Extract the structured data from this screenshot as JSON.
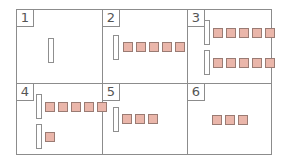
{
  "diagram": {
    "grid": {
      "columns": 3,
      "rows": 2
    },
    "colors": {
      "square_fill": "#eab6aa",
      "square_border": "#9a7b73",
      "bar_border": "#8f8f8f",
      "grid_line": "#8c8c8c"
    },
    "cells": [
      {
        "label": "1",
        "rows": [
          {
            "bar": true,
            "squares": 0
          }
        ]
      },
      {
        "label": "2",
        "rows": [
          {
            "bar": true,
            "squares": 5
          }
        ]
      },
      {
        "label": "3",
        "rows": [
          {
            "bar": true,
            "squares": 5
          },
          {
            "bar": true,
            "squares": 5
          }
        ]
      },
      {
        "label": "4",
        "rows": [
          {
            "bar": true,
            "squares": 5
          },
          {
            "bar": true,
            "squares": 1
          }
        ]
      },
      {
        "label": "5",
        "rows": [
          {
            "bar": true,
            "squares": 3
          }
        ]
      },
      {
        "label": "6",
        "rows": [
          {
            "bar": false,
            "squares": 3
          }
        ]
      }
    ]
  }
}
